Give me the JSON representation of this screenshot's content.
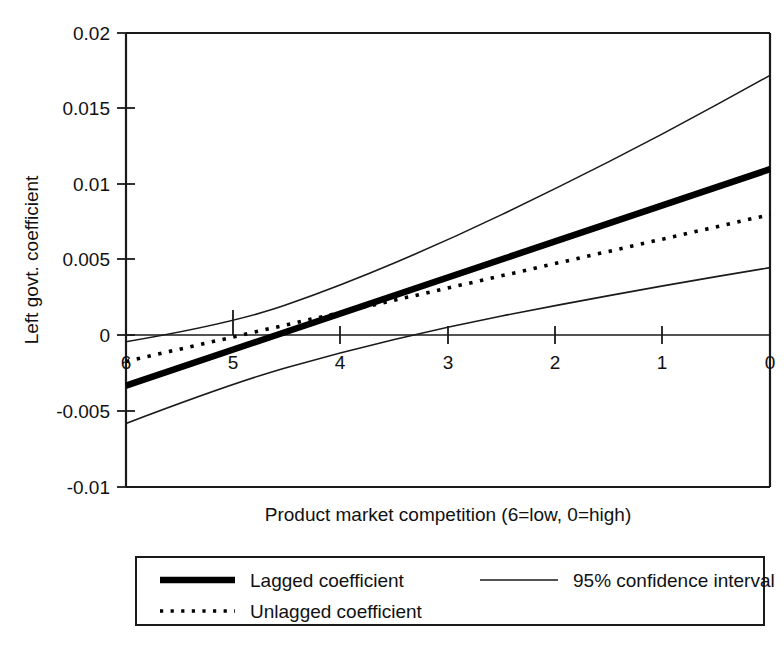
{
  "chart_data": {
    "type": "line",
    "title": "",
    "xlabel": "Product market competition (6=low, 0=high)",
    "ylabel": "Left govt. coefficient",
    "xlim": [
      6,
      0
    ],
    "ylim": [
      -0.01,
      0.02
    ],
    "x_ticks": [
      "6",
      "5",
      "4",
      "3",
      "2",
      "1",
      "0"
    ],
    "x_tick_values": [
      6,
      5,
      4,
      3,
      2,
      1,
      0
    ],
    "y_ticks": [
      "0.02",
      "0.015",
      "0.01",
      "0.005",
      "0",
      "-0.005",
      "-0.01"
    ],
    "y_tick_values": [
      0.02,
      0.015,
      0.01,
      0.005,
      0,
      -0.005,
      -0.01
    ],
    "x_axis_reversed": true,
    "grid": false,
    "zero_line": true,
    "legend_position": "below-outside",
    "series": [
      {
        "name": "Lagged coefficient",
        "style": "thick-solid",
        "x": [
          6,
          0
        ],
        "values": [
          -0.0033,
          0.011
        ]
      },
      {
        "name": "Unlagged coefficient",
        "style": "dotted",
        "x": [
          6,
          0
        ],
        "values": [
          -0.0017,
          0.008
        ]
      },
      {
        "name": "95% confidence interval",
        "style": "thin-solid-upper",
        "x": [
          6,
          5,
          4,
          3,
          2,
          1,
          0
        ],
        "values": [
          -0.0004,
          0.0008,
          0.0033,
          0.0063,
          0.0097,
          0.0133,
          0.0172
        ]
      },
      {
        "name": "95% confidence interval",
        "style": "thin-solid-lower",
        "x": [
          6,
          5,
          4,
          3,
          2,
          1,
          0
        ],
        "values": [
          -0.0058,
          -0.0031,
          -0.0011,
          0.0006,
          0.002,
          0.0033,
          0.0045
        ]
      }
    ],
    "colors": {
      "line": "#000000",
      "axis": "#1a1a1a",
      "background": "#ffffff"
    }
  },
  "legend": {
    "entries": [
      {
        "label": "Lagged coefficient",
        "style": "thick-solid"
      },
      {
        "label": "95% confidence interval",
        "style": "thin-solid"
      },
      {
        "label": "Unlagged coefficient",
        "style": "dotted"
      }
    ]
  }
}
